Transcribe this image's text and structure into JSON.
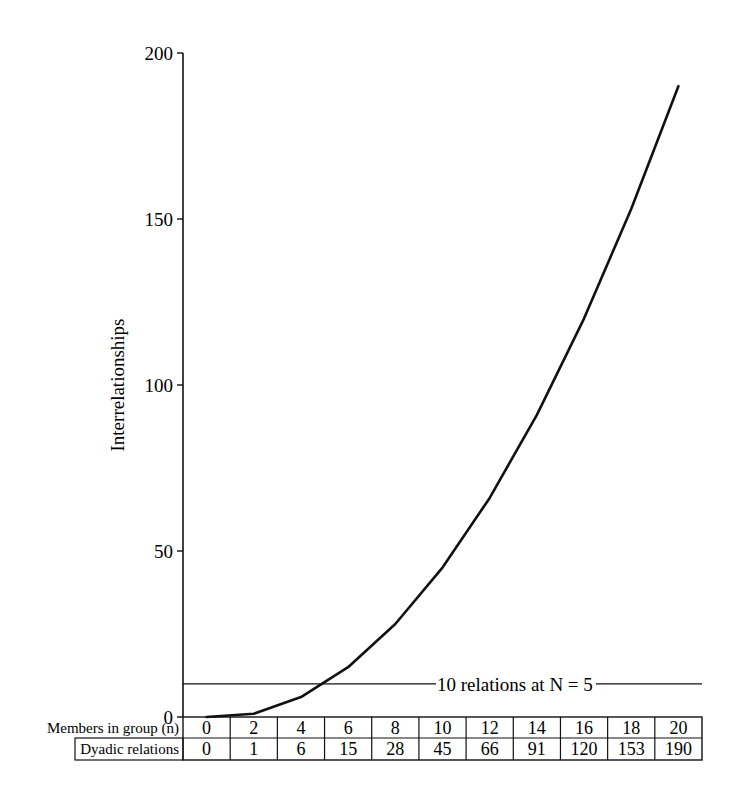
{
  "chart_data": {
    "type": "line",
    "title": "",
    "xlabel": "Members in group (n)",
    "ylabel": "Interrelationships",
    "ylim": [
      0,
      200
    ],
    "yticks": [
      0,
      50,
      100,
      150,
      200
    ],
    "grid": false,
    "x": [
      0,
      2,
      4,
      6,
      8,
      10,
      12,
      14,
      16,
      18,
      20
    ],
    "series": [
      {
        "name": "Dyadic relations",
        "values": [
          0,
          1,
          6,
          15,
          28,
          45,
          66,
          91,
          120,
          153,
          190
        ]
      }
    ],
    "annotations": [
      {
        "type": "hline",
        "y": 10,
        "text": "10 relations at N = 5"
      }
    ],
    "table": {
      "rows": [
        {
          "label": "Members in group (n)",
          "values": [
            "0",
            "2",
            "4",
            "6",
            "8",
            "10",
            "12",
            "14",
            "16",
            "18",
            "20"
          ]
        },
        {
          "label": "Dyadic relations",
          "values": [
            "0",
            "1",
            "6",
            "15",
            "28",
            "45",
            "66",
            "91",
            "120",
            "153",
            "190"
          ]
        }
      ]
    }
  }
}
